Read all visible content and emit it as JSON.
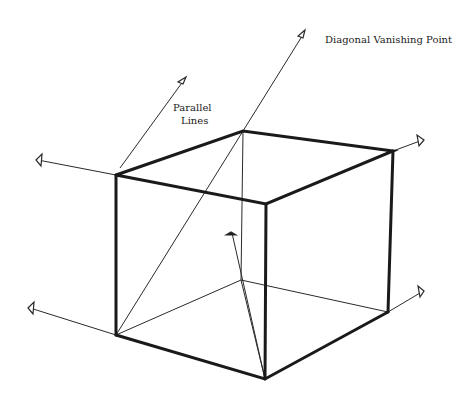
{
  "labels": {
    "diagonal_vanishing_point": "Diagonal Vanishing Point",
    "parallel_lines_1": "Parallel",
    "parallel_lines_2": "Lines"
  },
  "colors": {
    "ink": "#1a1a1a",
    "background": "#ffffff"
  }
}
